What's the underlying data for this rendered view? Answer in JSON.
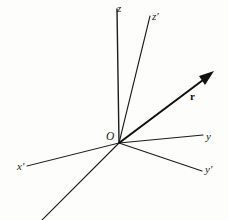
{
  "figure": {
    "background_color": "#fdfdfc",
    "line_color": "#1c1c1c",
    "labels": {
      "origin": "O",
      "z_axis": "z",
      "z_prime_axis": "z′",
      "y_axis": "y",
      "y_prime_axis": "y′",
      "x_prime_axis": "x′",
      "vector": "r"
    },
    "geometry": {
      "origin": {
        "x": 119,
        "y": 143
      },
      "axes": [
        {
          "name": "z",
          "from": [
            119,
            143
          ],
          "to": [
            117,
            9
          ],
          "style": "solid",
          "width": 1.3
        },
        {
          "name": "z-prime",
          "from": [
            119,
            143
          ],
          "to": [
            150,
            16
          ],
          "style": "solid",
          "width": 1.2
        },
        {
          "name": "y",
          "from": [
            119,
            143
          ],
          "to": [
            203,
            135
          ],
          "style": "solid",
          "width": 1.2
        },
        {
          "name": "y-prime",
          "from": [
            119,
            143
          ],
          "to": [
            202,
            171
          ],
          "style": "solid",
          "width": 1.2
        },
        {
          "name": "x-prime",
          "from": [
            119,
            143
          ],
          "to": [
            27,
            166
          ],
          "style": "solid",
          "width": 1.1
        },
        {
          "name": "x",
          "from": [
            119,
            143
          ],
          "to": [
            41,
            220
          ],
          "style": "solid",
          "width": 1.2
        }
      ],
      "vector": {
        "name": "r",
        "from": [
          119,
          143
        ],
        "to": [
          213,
          72
        ],
        "width": 2.0,
        "arrowhead": true
      }
    }
  }
}
